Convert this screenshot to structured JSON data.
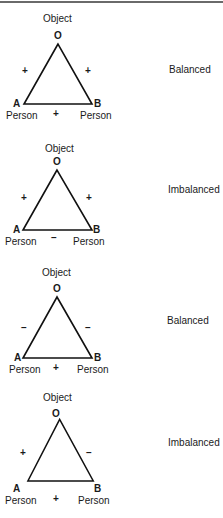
{
  "diagram": {
    "line_color": "#111111",
    "triads": [
      {
        "object_label": "Object",
        "vertex_o": "O",
        "vertex_a": "A",
        "vertex_b": "B",
        "person_a_label": "Person",
        "person_b_label": "Person",
        "sign_ao": "+",
        "sign_bo": "+",
        "sign_ab": "+",
        "status": "Balanced"
      },
      {
        "object_label": "Object",
        "vertex_o": "O",
        "vertex_a": "A",
        "vertex_b": "B",
        "person_a_label": "Person",
        "person_b_label": "Person",
        "sign_ao": "+",
        "sign_bo": "+",
        "sign_ab": "–",
        "status": "Imbalanced"
      },
      {
        "object_label": "Object",
        "vertex_o": "O",
        "vertex_a": "A",
        "vertex_b": "B",
        "person_a_label": "Person",
        "person_b_label": "Person",
        "sign_ao": "–",
        "sign_bo": "–",
        "sign_ab": "+",
        "status": "Balanced"
      },
      {
        "object_label": "Object",
        "vertex_o": "O",
        "vertex_a": "A",
        "vertex_b": "B",
        "person_a_label": "Person",
        "person_b_label": "Person",
        "sign_ao": "+",
        "sign_bo": "–",
        "sign_ab": "+",
        "status": "Imbalanced"
      }
    ]
  }
}
